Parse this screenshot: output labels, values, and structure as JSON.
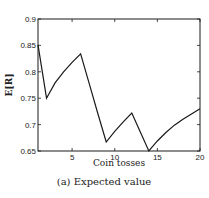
{
  "chart_data": {
    "type": "line",
    "title": "",
    "caption": "(a) Expected value",
    "xlabel": "Coin tosses",
    "ylabel": "E[R]",
    "xlim": [
      1,
      20
    ],
    "ylim": [
      0.65,
      0.9
    ],
    "xticks": [
      5,
      10,
      15,
      20
    ],
    "yticks": [
      0.65,
      0.7,
      0.75,
      0.8,
      0.85,
      0.9
    ],
    "ytick_labels": [
      "0.65",
      "0.7",
      "0.75",
      "0.8",
      "0.85",
      "0.9"
    ],
    "xtick_labels": [
      "5",
      "10",
      "15",
      "20"
    ],
    "grid": false,
    "legend": null,
    "series": [
      {
        "name": "E[R]",
        "color": "#1a1a1a",
        "x": [
          1,
          2,
          3,
          4,
          5,
          6,
          7,
          8,
          9,
          10,
          11,
          12,
          13,
          14,
          15,
          16,
          17,
          18,
          19,
          20
        ],
        "values": [
          0.851,
          0.75,
          0.779,
          0.8,
          0.818,
          0.834,
          0.778,
          0.722,
          0.667,
          0.687,
          0.705,
          0.722,
          0.686,
          0.65,
          0.669,
          0.685,
          0.699,
          0.71,
          0.72,
          0.73
        ]
      }
    ]
  }
}
